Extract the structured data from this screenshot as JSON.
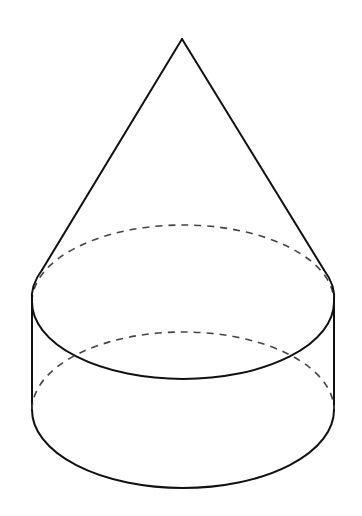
{
  "diagram": {
    "colors": {
      "background": "#ffffff",
      "line": "#111111",
      "hidden_line": "#444444"
    },
    "cone": {
      "apex": [
        182,
        39
      ],
      "left_tangent": [
        42,
        270
      ],
      "right_tangent": [
        324,
        270
      ]
    },
    "cylinder": {
      "top_ellipse": {
        "cx": 183,
        "cy": 302,
        "rx": 151,
        "ry": 77
      },
      "bottom_ellipse": {
        "cx": 183,
        "cy": 410,
        "rx": 151,
        "ry": 78
      }
    },
    "labels": []
  }
}
